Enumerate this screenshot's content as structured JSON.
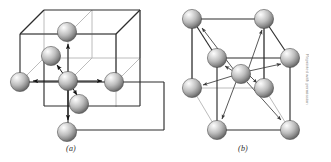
{
  "figure": {
    "background_color": "#ffffff",
    "width": 331,
    "height": 162,
    "credit_text": "Reprinted with permission",
    "panels": [
      {
        "id": "a",
        "caption": "(a)",
        "description": "simple cubic lattice block with octahedral six-fold coordination arrows",
        "coordination_number": 6,
        "arrow_count": 6,
        "sphere_count": 6,
        "cube_count": 8
      },
      {
        "id": "b",
        "caption": "(b)",
        "description": "body-centered cubic unit cell with eight-fold coordination arrows",
        "coordination_number": 8,
        "arrow_count": 8,
        "sphere_count": 9,
        "cube_count": 1
      }
    ]
  },
  "style_colors": {
    "wire_dark": "#2d2d2d",
    "wire_light": "#b0b0b0",
    "arrow": "#1a1a1a",
    "arrow_light": "#7d7d7d",
    "sphere_highlight": "#f2f2f2",
    "sphere_mid": "#b8b8b8",
    "sphere_shadow": "#5a5a5a",
    "sphere_edge": "#3c3c3c",
    "caption_color": "#2b2b2b"
  },
  "panel_a": {
    "spheres": [
      {
        "name": "sphere-top",
        "cx": 67,
        "cy": 32,
        "r": 9.5
      },
      {
        "name": "sphere-upper-left",
        "cx": 51,
        "cy": 56,
        "r": 9.5
      },
      {
        "name": "sphere-center",
        "cx": 68,
        "cy": 81,
        "r": 9.5
      },
      {
        "name": "sphere-left",
        "cx": 20,
        "cy": 82,
        "r": 9.5
      },
      {
        "name": "sphere-right",
        "cx": 114,
        "cy": 82,
        "r": 9.5
      },
      {
        "name": "sphere-lower-front",
        "cx": 79,
        "cy": 104,
        "r": 9.5
      },
      {
        "name": "sphere-bottom",
        "cx": 67,
        "cy": 132,
        "r": 9.5
      }
    ],
    "arrows": [
      {
        "name": "arrow-up",
        "x1": 68,
        "y1": 74,
        "x2": 68,
        "y2": 43
      },
      {
        "name": "arrow-down",
        "x1": 68,
        "y1": 88,
        "x2": 68,
        "y2": 121
      },
      {
        "name": "arrow-left",
        "x1": 59,
        "y1": 81,
        "x2": 32,
        "y2": 81
      },
      {
        "name": "arrow-right",
        "x1": 77,
        "y1": 81,
        "x2": 103,
        "y2": 81
      },
      {
        "name": "arrow-back-upleft",
        "x1": 63,
        "y1": 75,
        "x2": 57,
        "y2": 64
      },
      {
        "name": "arrow-front-lowright",
        "x1": 72,
        "y1": 88,
        "x2": 77,
        "y2": 96
      }
    ]
  },
  "panel_b": {
    "spheres": [
      {
        "name": "sphere-back-top-left",
        "cx": 192,
        "cy": 19,
        "r": 9.5
      },
      {
        "name": "sphere-back-top-right",
        "cx": 264,
        "cy": 19,
        "r": 9.5
      },
      {
        "name": "sphere-front-top-left",
        "cx": 217,
        "cy": 58,
        "r": 9.5
      },
      {
        "name": "sphere-front-top-right",
        "cx": 290,
        "cy": 58,
        "r": 9.5
      },
      {
        "name": "sphere-body-center",
        "cx": 241,
        "cy": 74,
        "r": 9.5
      },
      {
        "name": "sphere-back-bottom-left",
        "cx": 192,
        "cy": 88,
        "r": 9.5
      },
      {
        "name": "sphere-back-bottom-right",
        "cx": 264,
        "cy": 88,
        "r": 9.5
      },
      {
        "name": "sphere-front-bottom-left",
        "cx": 217,
        "cy": 130,
        "r": 9.5
      },
      {
        "name": "sphere-front-bottom-right",
        "cx": 290,
        "cy": 130,
        "r": 9.5
      }
    ],
    "arrows": [
      {
        "name": "arrow-to-back-top-left",
        "x1": 234,
        "y1": 70,
        "x2": 201,
        "y2": 28
      },
      {
        "name": "arrow-to-back-top-right",
        "x1": 248,
        "y1": 70,
        "x2": 262,
        "y2": 29
      },
      {
        "name": "arrow-to-front-top-left",
        "x1": 233,
        "y1": 71,
        "x2": 224,
        "y2": 66
      },
      {
        "name": "arrow-to-front-top-right",
        "x1": 249,
        "y1": 71,
        "x2": 282,
        "y2": 63
      },
      {
        "name": "arrow-to-back-bottom-left",
        "x1": 232,
        "y1": 76,
        "x2": 202,
        "y2": 85
      },
      {
        "name": "arrow-to-back-bottom-right",
        "x1": 250,
        "y1": 76,
        "x2": 258,
        "y2": 84
      },
      {
        "name": "arrow-to-front-bottom-left",
        "x1": 236,
        "y1": 82,
        "x2": 221,
        "y2": 120
      },
      {
        "name": "arrow-to-front-bottom-right",
        "x1": 247,
        "y1": 82,
        "x2": 282,
        "y2": 121
      }
    ]
  }
}
